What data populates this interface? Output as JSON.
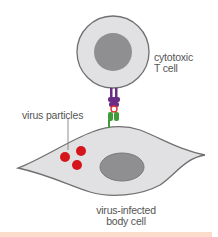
{
  "labels": {
    "t_cell": [
      "cytotoxic",
      "T cell"
    ],
    "virus_particles": "virus particles",
    "body_cell": [
      "virus-infected",
      "body cell"
    ]
  },
  "colors": {
    "cell_fill": "#e1e1e3",
    "cell_stroke": "#707070",
    "nucleus_fill": "#8f8f91",
    "virus": "#d4161c",
    "receptor": "#6b2c86",
    "mhc": "#3f9b3a",
    "antigen": "#e03030",
    "band": "#fbdcca"
  }
}
